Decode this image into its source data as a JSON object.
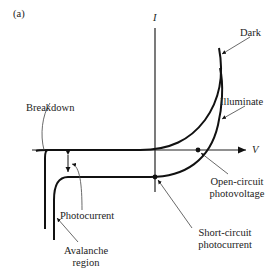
{
  "panel_label": "(a)",
  "axes": {
    "y_label": "I",
    "x_label": "V"
  },
  "curves": {
    "dark": "Dark",
    "illuminated": "Illuminate"
  },
  "annotations": {
    "breakdown": "Breakdown",
    "photocurrent": "Photocurrent",
    "avalanche_line1": "Avalanche",
    "avalanche_line2": "region",
    "open_circuit_line1": "Open-circuit",
    "open_circuit_line2": "photovoltage",
    "short_circuit_line1": "Short-circuit",
    "short_circuit_line2": "photocurrent"
  },
  "colors": {
    "curve": "#111111",
    "leader": "#444444",
    "text": "#222222"
  }
}
